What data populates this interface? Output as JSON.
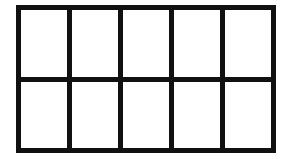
{
  "diagram": {
    "type": "grid",
    "rows": 2,
    "columns": 5,
    "cells": [
      {
        "row": 1,
        "col": 1,
        "filled": false
      },
      {
        "row": 1,
        "col": 2,
        "filled": false
      },
      {
        "row": 1,
        "col": 3,
        "filled": false
      },
      {
        "row": 1,
        "col": 4,
        "filled": false
      },
      {
        "row": 1,
        "col": 5,
        "filled": false
      },
      {
        "row": 2,
        "col": 1,
        "filled": false
      },
      {
        "row": 2,
        "col": 2,
        "filled": false
      },
      {
        "row": 2,
        "col": 3,
        "filled": false
      },
      {
        "row": 2,
        "col": 4,
        "filled": false
      },
      {
        "row": 2,
        "col": 5,
        "filled": false
      }
    ],
    "colors": {
      "line": "#111111",
      "cell": "#ffffff"
    }
  }
}
